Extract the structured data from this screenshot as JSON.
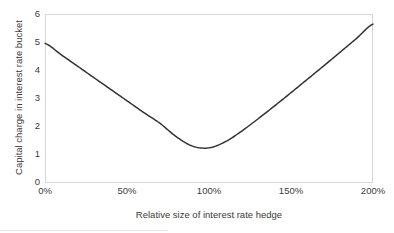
{
  "chart_data": {
    "type": "line",
    "title": "",
    "xlabel": "Relative size of interest rate hedge",
    "ylabel": "Capital charge in interest rate bucket",
    "xlim": [
      0,
      200
    ],
    "ylim": [
      0,
      6
    ],
    "xtick_labels": [
      "0%",
      "50%",
      "100%",
      "150%",
      "200%"
    ],
    "xtick_values": [
      0,
      50,
      100,
      150,
      200
    ],
    "ytick_labels": [
      "0",
      "1",
      "2",
      "3",
      "4",
      "5",
      "6"
    ],
    "ytick_values": [
      0,
      1,
      2,
      3,
      4,
      5,
      6
    ],
    "grid": "top-only",
    "legend": "none",
    "line_color": "#333333",
    "axis_color": "#d9d9d9",
    "background": "#ffffff",
    "series": [
      {
        "name": "Capital charge",
        "x": [
          0,
          10,
          20,
          30,
          40,
          50,
          60,
          70,
          80,
          90,
          100,
          110,
          120,
          130,
          140,
          150,
          160,
          170,
          180,
          190,
          200
        ],
        "values": [
          4.95,
          4.54,
          4.13,
          3.72,
          3.31,
          2.9,
          2.49,
          2.1,
          1.62,
          1.28,
          1.22,
          1.44,
          1.82,
          2.26,
          2.72,
          3.19,
          3.67,
          4.15,
          4.64,
          5.13,
          5.64
        ]
      }
    ],
    "minimum": {
      "x": 92,
      "y": 1.21
    }
  },
  "labels": {
    "x_axis_title": "Relative size of interest rate hedge",
    "y_axis_title": "Capital charge in interest rate bucket"
  }
}
